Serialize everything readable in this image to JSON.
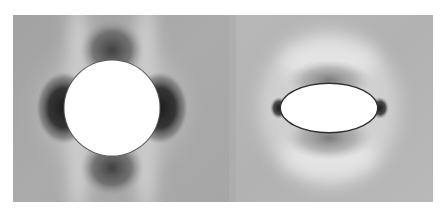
{
  "figure": {
    "type": "field-visualization",
    "panels": [
      {
        "id": "left",
        "inclusion_shape": "circle",
        "inclusion_fill": "#ffffff",
        "background_gray": "#a9a9a9",
        "lobe_count": 4,
        "lobe_positions": [
          "left",
          "right",
          "top",
          "bottom"
        ]
      },
      {
        "id": "right",
        "inclusion_shape": "ellipse",
        "inclusion_fill": "#ffffff",
        "background_gray": "#b4b4b4",
        "lobe_count": 2,
        "lobe_positions": [
          "left",
          "right"
        ],
        "diffuse_shadow_positions": [
          "top",
          "bottom"
        ]
      }
    ],
    "colors": {
      "page_background": "#ffffff",
      "lobe_dark": "#2a2a2a",
      "halo_light": "#e6e6e6",
      "outline": "#3a3a3a"
    }
  }
}
